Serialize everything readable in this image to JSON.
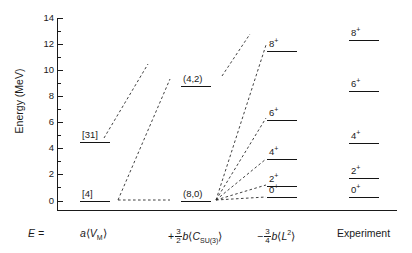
{
  "axis": {
    "y_title": "Energy (MeV)",
    "y_ticks": [
      "0",
      "2",
      "4",
      "6",
      "8",
      "10",
      "12",
      "14"
    ],
    "y_min": 0,
    "y_max": 14
  },
  "formula_row": {
    "equals_label": "E =",
    "term1_plain": "a ⟨V_M⟩",
    "term2_plain": "+ 3/2 b ⟨C_SU(3)⟩",
    "term3_plain": "− 3/4 b ⟨L²⟩",
    "term1": {
      "coef": "a",
      "open": "⟨",
      "sym": "V",
      "sub": "M",
      "close": "⟩"
    },
    "term2": {
      "sign": "+",
      "num": "3",
      "den": "2",
      "coef": "b",
      "open": "⟨",
      "sym": "C",
      "sub": "SU(3)",
      "close": "⟩"
    },
    "term3": {
      "sign": "−",
      "num": "3",
      "den": "4",
      "coef": "b",
      "open": "⟨",
      "sym": "L",
      "sup": "2",
      "close": "⟩"
    },
    "experiment_label": "Experiment"
  },
  "chart_data": {
    "type": "line",
    "title": "",
    "xlabel": "",
    "ylabel": "Energy (MeV)",
    "ylim": [
      0,
      14
    ],
    "grid": false,
    "legend": "none",
    "columns": [
      {
        "name": "a⟨V_M⟩",
        "x_center": 95,
        "levels": [
          {
            "label": "[4]",
            "energy": 0.0
          },
          {
            "label": "[31]",
            "energy": 4.5
          }
        ]
      },
      {
        "name": "+3/2 b⟨C_SU(3)⟩",
        "x_center": 196,
        "levels": [
          {
            "label": "(8,0)",
            "energy": 0.0
          },
          {
            "label": "(4,2)",
            "energy": 8.8
          }
        ]
      },
      {
        "name": "−3/4 b⟨L²⟩",
        "x_center": 282,
        "levels": [
          {
            "label": "0",
            "superscript": "+",
            "energy": 0.25
          },
          {
            "label": "2",
            "superscript": "+",
            "energy": 1.15
          },
          {
            "label": "4",
            "superscript": "+",
            "energy": 3.15
          },
          {
            "label": "6",
            "superscript": "+",
            "energy": 6.15
          },
          {
            "label": "8",
            "superscript": "+",
            "energy": 11.5
          }
        ]
      },
      {
        "name": "Experiment",
        "x_center": 364,
        "levels": [
          {
            "label": "0",
            "superscript": "+",
            "energy": 0.3
          },
          {
            "label": "2",
            "superscript": "+",
            "energy": 1.75
          },
          {
            "label": "4",
            "superscript": "+",
            "energy": 4.4
          },
          {
            "label": "6",
            "superscript": "+",
            "energy": 8.4
          },
          {
            "label": "8",
            "superscript": "+",
            "energy": 12.3
          }
        ]
      }
    ]
  }
}
